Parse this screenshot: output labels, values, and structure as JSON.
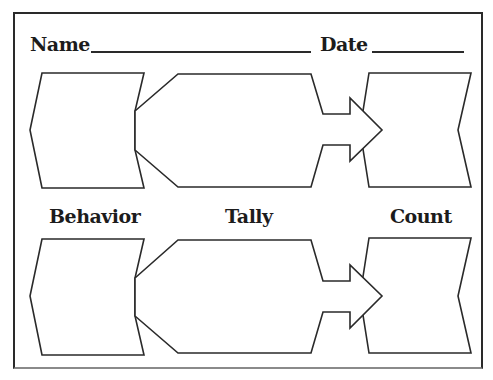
{
  "header": {
    "name_label": "Name",
    "date_label": "Date",
    "name_value": "",
    "date_value": ""
  },
  "columns": {
    "behavior": "Behavior",
    "tally": "Tally",
    "count": "Count"
  },
  "rows": [
    {
      "behavior": "",
      "tally": "",
      "count": ""
    },
    {
      "behavior": "",
      "tally": "",
      "count": ""
    }
  ],
  "colors": {
    "stroke": "#2a2a2a",
    "fill": "#ffffff",
    "text": "#1c1c1c"
  }
}
